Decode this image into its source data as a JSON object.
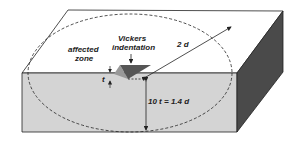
{
  "diagram": {
    "labels": {
      "vickers_line1": "Vickers",
      "vickers_line2": "indentation",
      "affected_line1": "affected",
      "affected_line2": "zone",
      "radius": "2 d",
      "thickness": "t",
      "depth": "10 t = 1.4 d"
    },
    "colors": {
      "top_face": "#ffffff",
      "front_face": "#d4d4d4",
      "side_face": "#4a4a4a",
      "indent_dark": "#555555",
      "indent_light": "#999999",
      "outline": "#222222"
    }
  }
}
